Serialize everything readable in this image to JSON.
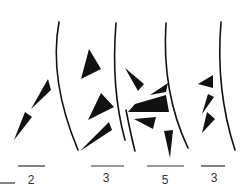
{
  "figure": {
    "ink_color": "#111111",
    "background": "#ffffff",
    "scale_bars": [
      {
        "label": "2",
        "x1": 18,
        "x2": 45,
        "y": 166,
        "label_x": 31
      },
      {
        "label": "3",
        "x1": 91,
        "x2": 124,
        "y": 166,
        "label_x": 106
      },
      {
        "label": "5",
        "x1": 147,
        "x2": 184,
        "y": 166,
        "label_x": 165
      },
      {
        "label": "3",
        "x1": 201,
        "x2": 225,
        "y": 166,
        "label_x": 214
      }
    ]
  }
}
